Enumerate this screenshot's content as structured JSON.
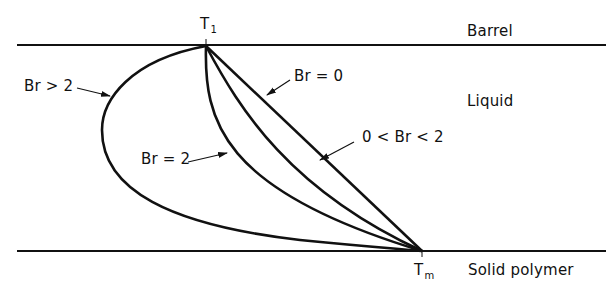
{
  "diagram": {
    "colors": {
      "stroke": "#111111",
      "background": "#ffffff"
    },
    "regions": {
      "barrel": "Barrel",
      "liquid": "Liquid",
      "solid": "Solid polymer"
    },
    "points": {
      "top": {
        "main": "T",
        "sub": "1"
      },
      "bottom": {
        "main": "T",
        "sub": "m"
      }
    },
    "curves": [
      {
        "id": "br-0",
        "label": "Br = 0"
      },
      {
        "id": "br-between",
        "label": "0 < Br < 2"
      },
      {
        "id": "br-2",
        "label": "Br = 2"
      },
      {
        "id": "br-gt-2",
        "label": "Br > 2"
      }
    ]
  }
}
